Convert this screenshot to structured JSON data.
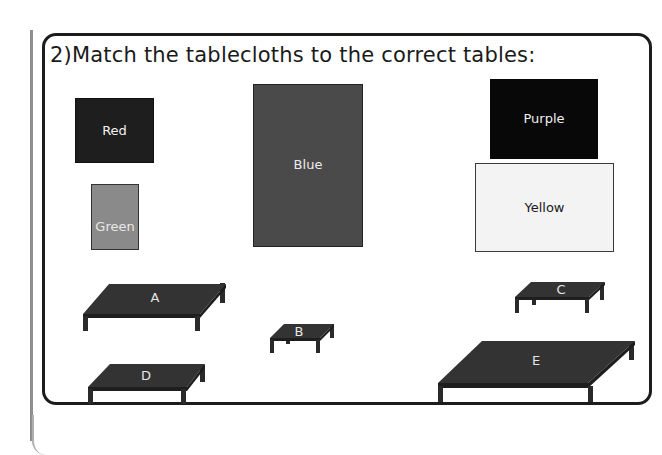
{
  "question": {
    "number": "2)",
    "text": "Match the tablecloths to the correct tables:"
  },
  "tablecloths": [
    {
      "label": "Red",
      "color": "#1e1e1e",
      "text_color": "#f2f2f2"
    },
    {
      "label": "Green",
      "color": "#8a8a8a",
      "text_color": "#e8e8e8"
    },
    {
      "label": "Blue",
      "color": "#4a4a4a",
      "text_color": "#ececec"
    },
    {
      "label": "Purple",
      "color": "#080808",
      "text_color": "#f0f0f0"
    },
    {
      "label": "Yellow",
      "color": "#f3f3f3",
      "text_color": "#1a1a1a"
    }
  ],
  "tables": [
    {
      "label": "A"
    },
    {
      "label": "B"
    },
    {
      "label": "C"
    },
    {
      "label": "D"
    },
    {
      "label": "E"
    }
  ],
  "colors": {
    "table_top": "#333333",
    "table_leg": "#2a2a2a",
    "frame": "#1c1c1c"
  }
}
